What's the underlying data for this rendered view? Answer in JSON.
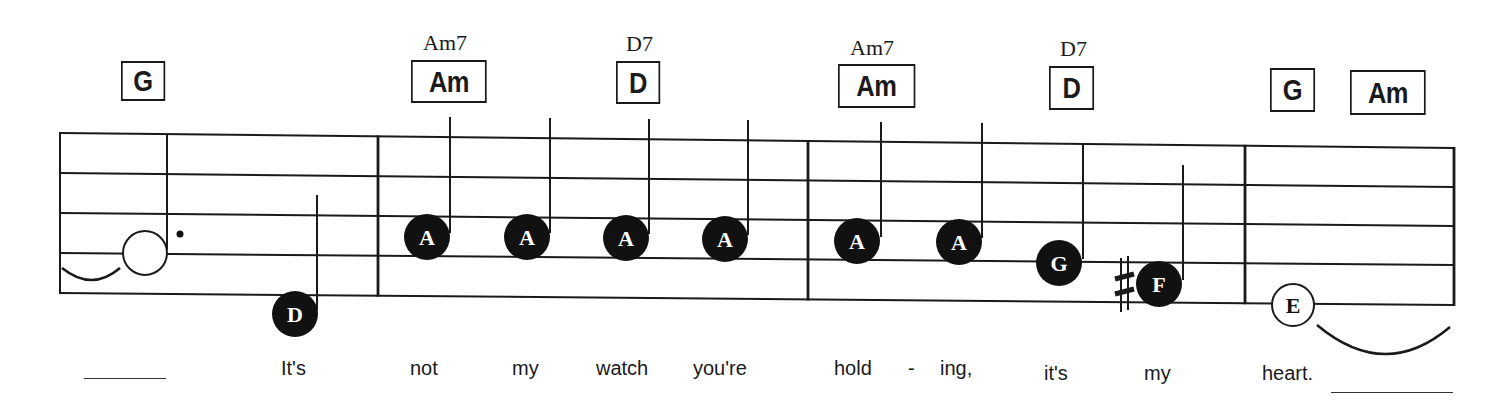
{
  "sheet": {
    "title": "Lead sheet excerpt",
    "staff": {
      "left_x": 60,
      "right_x": 1454,
      "lines_left_y": [
        133,
        173,
        213,
        253,
        293
      ],
      "lines_right_y": [
        148,
        187,
        226,
        265,
        305
      ],
      "barlines_x": [
        60,
        378,
        808,
        1245,
        1454
      ],
      "line_color": "#1a1a1a"
    },
    "chords": [
      {
        "id": "g-1",
        "symbol": "G",
        "extension": "",
        "box_x": 121,
        "box_y": 61,
        "box_w": 44,
        "box_h": 40
      },
      {
        "id": "am-1",
        "symbol": "Am",
        "extension": "Am7",
        "box_x": 411,
        "box_y": 60,
        "box_w": 76,
        "box_h": 43,
        "ext_x": 423,
        "ext_y": 30
      },
      {
        "id": "d-1",
        "symbol": "D",
        "extension": "D7",
        "box_x": 616,
        "box_y": 61,
        "box_w": 44,
        "box_h": 43,
        "ext_x": 626,
        "ext_y": 31
      },
      {
        "id": "am-2",
        "symbol": "Am",
        "extension": "Am7",
        "box_x": 838,
        "box_y": 64,
        "box_w": 77,
        "box_h": 44,
        "ext_x": 850,
        "ext_y": 35
      },
      {
        "id": "d-2",
        "symbol": "D",
        "extension": "D7",
        "box_x": 1049,
        "box_y": 66,
        "box_w": 45,
        "box_h": 44,
        "ext_x": 1060,
        "ext_y": 36
      },
      {
        "id": "g-2",
        "symbol": "G",
        "extension": "",
        "box_x": 1270,
        "box_y": 68,
        "box_w": 45,
        "box_h": 44
      },
      {
        "id": "am-3",
        "symbol": "Am",
        "extension": "",
        "box_x": 1350,
        "box_y": 70,
        "box_w": 76,
        "box_h": 45
      }
    ],
    "notes": [
      {
        "id": "n1",
        "letter": "",
        "style": "open-dotted-half",
        "cx": 145,
        "cy": 253,
        "stem_x": 167,
        "stem_top": 135,
        "stem_bottom": 250
      },
      {
        "id": "n2",
        "letter": "D",
        "style": "filled",
        "cx": 295,
        "cy": 314,
        "stem_x": 317,
        "stem_top": 195,
        "stem_bottom": 310
      },
      {
        "id": "n3",
        "letter": "A",
        "style": "filled",
        "cx": 427,
        "cy": 237,
        "stem_x": 450,
        "stem_top": 117,
        "stem_bottom": 233
      },
      {
        "id": "n4",
        "letter": "A",
        "style": "filled",
        "cx": 527,
        "cy": 237,
        "stem_x": 550,
        "stem_top": 118,
        "stem_bottom": 233
      },
      {
        "id": "n5",
        "letter": "A",
        "style": "filled",
        "cx": 626,
        "cy": 238,
        "stem_x": 649,
        "stem_top": 119,
        "stem_bottom": 234
      },
      {
        "id": "n6",
        "letter": "A",
        "style": "filled",
        "cx": 725,
        "cy": 239,
        "stem_x": 748,
        "stem_top": 120,
        "stem_bottom": 235
      },
      {
        "id": "n7",
        "letter": "A",
        "style": "filled",
        "cx": 857,
        "cy": 241,
        "stem_x": 881,
        "stem_top": 122,
        "stem_bottom": 237
      },
      {
        "id": "n8",
        "letter": "A",
        "style": "filled",
        "cx": 959,
        "cy": 242,
        "stem_x": 982,
        "stem_top": 123,
        "stem_bottom": 238
      },
      {
        "id": "n9",
        "letter": "G",
        "style": "filled",
        "cx": 1059,
        "cy": 263,
        "stem_x": 1083,
        "stem_top": 144,
        "stem_bottom": 259
      },
      {
        "id": "n10",
        "letter": "F",
        "style": "filled",
        "cx": 1159,
        "cy": 284,
        "stem_x": 1183,
        "stem_top": 165,
        "stem_bottom": 280,
        "accidental": "sharp",
        "acc_x": 1124,
        "acc_y": 285
      },
      {
        "id": "n11",
        "letter": "E",
        "style": "open",
        "cx": 1293,
        "cy": 305
      }
    ],
    "ties": [
      {
        "id": "tie-in",
        "d": "M62 268 Q92 292 120 268"
      },
      {
        "id": "tie-out",
        "d": "M1317 325 Q1385 382 1450 327"
      }
    ],
    "dot": {
      "cx": 180,
      "cy": 234,
      "r": 3.5
    },
    "lyrics": [
      {
        "text": "It's",
        "x": 281
      },
      {
        "text": "not",
        "x": 410
      },
      {
        "text": "my",
        "x": 512
      },
      {
        "text": "watch",
        "x": 596
      },
      {
        "text": "you're",
        "x": 693
      },
      {
        "text": "hold",
        "x": 834
      },
      {
        "text": "-",
        "x": 908
      },
      {
        "text": "ing,",
        "x": 940
      },
      {
        "text": "it's",
        "x": 1044
      },
      {
        "text": "my",
        "x": 1144
      },
      {
        "text": "heart.",
        "x": 1262
      }
    ],
    "blanks": [
      {
        "x": 84,
        "y": 378,
        "w": 82
      },
      {
        "x": 1331,
        "y": 392,
        "w": 122
      }
    ]
  }
}
